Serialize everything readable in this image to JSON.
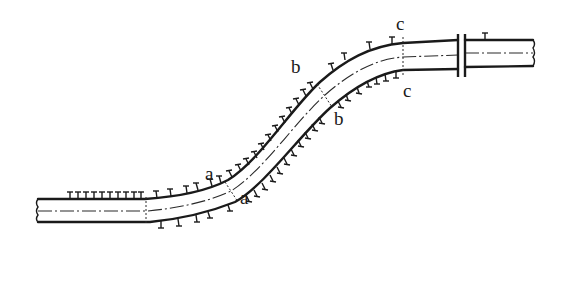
{
  "diagram": {
    "section_labels": [
      {
        "id": "a-top",
        "text": "a",
        "x": 205,
        "y": 180
      },
      {
        "id": "a-bottom",
        "text": "a",
        "x": 240,
        "y": 204
      },
      {
        "id": "b-top",
        "text": "b",
        "x": 291,
        "y": 73
      },
      {
        "id": "b-bottom",
        "text": "b",
        "x": 334,
        "y": 125
      },
      {
        "id": "c-top",
        "text": "c",
        "x": 396,
        "y": 30
      },
      {
        "id": "c-bottom",
        "text": "c",
        "x": 403,
        "y": 97
      }
    ],
    "colors": {
      "line": "#1a1a1a",
      "background": "#ffffff"
    }
  }
}
